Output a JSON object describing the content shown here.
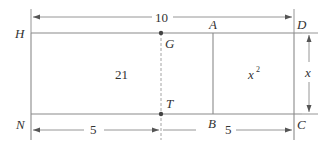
{
  "diagram": {
    "type": "geometry-rectangle-area",
    "points": {
      "H": "H",
      "G": "G",
      "A": "A",
      "D": "D",
      "N": "N",
      "T": "T",
      "B": "B",
      "C": "C"
    },
    "dimensions": {
      "top_total": "10",
      "bottom_left": "5",
      "bottom_right": "5",
      "right_side": "x"
    },
    "regions": {
      "left_area": "21",
      "right_area_base": "x",
      "right_area_exp": "2"
    },
    "colors": {
      "line": "#8a8a8a",
      "text": "#333333",
      "background": "#ffffff"
    }
  }
}
